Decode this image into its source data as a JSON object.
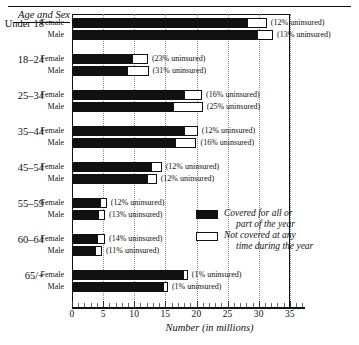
{
  "header": {
    "axis_group_title": "Age and Sex"
  },
  "legend": {
    "position": "inside-right",
    "items": [
      {
        "swatch": "covered",
        "line1": "Covered for all or",
        "line2": "part of the year"
      },
      {
        "swatch": "uninsured",
        "line1": "Not covered at any",
        "line2": "time during the year"
      }
    ]
  },
  "chart_data": {
    "type": "bar",
    "orientation": "horizontal",
    "stacked": true,
    "title": "",
    "xlabel": "Number (in millions)",
    "ylabel": "Age and Sex",
    "xlim": [
      0,
      37.5
    ],
    "grid": true,
    "gridlines": [
      5,
      10,
      15,
      20,
      25,
      30,
      35
    ],
    "xticks": [
      0,
      5,
      10,
      15,
      20,
      25,
      30,
      35
    ],
    "xtick_labels": [
      "0",
      "5",
      "10",
      "15",
      "20",
      "25",
      "30",
      "35"
    ],
    "minor_ticks": [
      1,
      2,
      3,
      4,
      6,
      7,
      8,
      9,
      11,
      12,
      13,
      14,
      16,
      17,
      18,
      19,
      21,
      22,
      23,
      24,
      26,
      27,
      28,
      29,
      31,
      32,
      33,
      34,
      36,
      37
    ],
    "series": [
      {
        "name": "Covered for all or part of the year",
        "color": "#111111"
      },
      {
        "name": "Not covered at any time during the year",
        "color": "#ffffff"
      }
    ],
    "groups": [
      {
        "group": "Under 18",
        "rows": [
          {
            "sex": "Female",
            "covered": 28.1,
            "uninsured": 3.2,
            "note": "(12% uninsured)"
          },
          {
            "sex": "Male",
            "covered": 29.7,
            "uninsured": 2.6,
            "note": "(13% uninsured)"
          }
        ]
      },
      {
        "group": "18–24",
        "rows": [
          {
            "sex": "Female",
            "covered": 9.6,
            "uninsured": 2.6,
            "note": "(23% uninsured)"
          },
          {
            "sex": "Male",
            "covered": 8.8,
            "uninsured": 3.5,
            "note": "(31% uninsured)"
          }
        ]
      },
      {
        "group": "25–34",
        "rows": [
          {
            "sex": "Female",
            "covered": 18.0,
            "uninsured": 2.9,
            "note": "(16% uninsured)"
          },
          {
            "sex": "Male",
            "covered": 16.2,
            "uninsured": 4.8,
            "note": "(25% uninsured)"
          }
        ]
      },
      {
        "group": "35–44",
        "rows": [
          {
            "sex": "Female",
            "covered": 18.0,
            "uninsured": 2.2,
            "note": "(12% uninsured)"
          },
          {
            "sex": "Male",
            "covered": 16.5,
            "uninsured": 3.5,
            "note": "(16% uninsured)"
          }
        ]
      },
      {
        "group": "45–54",
        "rows": [
          {
            "sex": "Female",
            "covered": 12.7,
            "uninsured": 1.7,
            "note": "(12% uninsured)"
          },
          {
            "sex": "Male",
            "covered": 12.0,
            "uninsured": 1.6,
            "note": "(12% uninsured)"
          }
        ]
      },
      {
        "group": "55–59",
        "rows": [
          {
            "sex": "Female",
            "covered": 4.5,
            "uninsured": 1.1,
            "note": "(12% uninsured)"
          },
          {
            "sex": "Male",
            "covered": 4.2,
            "uninsured": 1.1,
            "note": "(13% uninsured)"
          }
        ]
      },
      {
        "group": "60–64",
        "rows": [
          {
            "sex": "Female",
            "covered": 4.0,
            "uninsured": 1.3,
            "note": "(14% uninsured)"
          },
          {
            "sex": "Male",
            "covered": 3.7,
            "uninsured": 1.1,
            "note": "(11% uninsured)"
          }
        ]
      },
      {
        "group": "65/+",
        "rows": [
          {
            "sex": "Female",
            "covered": 17.8,
            "uninsured": 0.25,
            "note": "(1% uninsured)"
          },
          {
            "sex": "Male",
            "covered": 14.6,
            "uninsured": 0.2,
            "note": "(1% uninsured)"
          }
        ]
      }
    ]
  }
}
